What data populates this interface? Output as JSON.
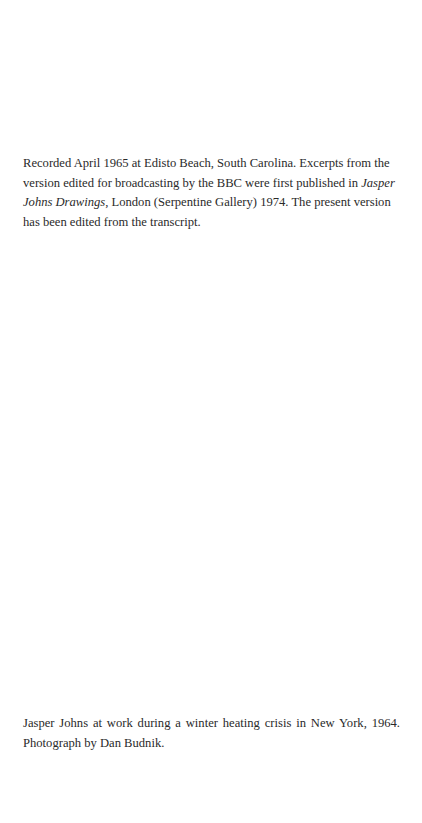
{
  "note": {
    "part1": "Recorded April 1965 at Edisto Beach, South Carolina. Excerpts from the version edited for broadcasting by the BBC were first published in ",
    "italic": "Jasper Johns Drawings",
    "part2": ", London (Serpentine Gallery) 1974. The present version has been edited from the transcript."
  },
  "caption": {
    "line1": "Jasper Johns at work during a winter heating crisis in New York, 1964.",
    "line2": "Photograph by Dan Budnik."
  }
}
